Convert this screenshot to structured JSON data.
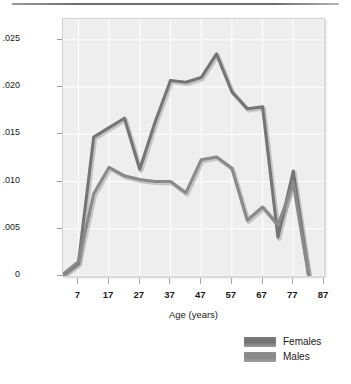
{
  "chart_data": {
    "type": "line",
    "title": "",
    "xlabel": "Age (years)",
    "ylabel": "Probability of onset",
    "xlim": [
      2,
      87
    ],
    "ylim": [
      0,
      0.0272
    ],
    "grid": true,
    "legend_position": "bottom-right",
    "xticks": [
      "7",
      "17",
      "27",
      "37",
      "47",
      "57",
      "67",
      "77",
      "87"
    ],
    "xtick_values": [
      7,
      17,
      27,
      37,
      47,
      57,
      67,
      77,
      87
    ],
    "yticks": [
      ".025",
      ".020",
      ".015",
      ".010",
      ".005",
      "0"
    ],
    "ytick_values": [
      0.025,
      0.02,
      0.015,
      0.01,
      0.005,
      0
    ],
    "x": [
      2,
      7,
      12,
      17,
      22,
      27,
      32,
      37,
      42,
      47,
      52,
      57,
      62,
      67,
      72,
      77,
      82
    ],
    "series": [
      {
        "name": "Females",
        "color": "#757575",
        "values": [
          0.0001,
          0.0013,
          0.0147,
          0.0157,
          0.0167,
          0.0113,
          0.0163,
          0.0207,
          0.0205,
          0.021,
          0.0235,
          0.0195,
          0.0177,
          0.0179,
          0.0041,
          0.0111,
          0.0
        ]
      },
      {
        "name": "Males",
        "color": "#8a8a8a",
        "values": [
          0.0002,
          0.0015,
          0.0087,
          0.0115,
          0.0106,
          0.0102,
          0.01,
          0.01,
          0.0088,
          0.0123,
          0.0126,
          0.0114,
          0.0059,
          0.0073,
          0.0054,
          0.0098,
          0.0
        ]
      }
    ]
  },
  "axes": {
    "ylabel": "Probability of onset",
    "xlabel": "Age (years)"
  },
  "legend": {
    "items": [
      {
        "label": "Females",
        "color": "#757575"
      },
      {
        "label": "Males",
        "color": "#8a8a8a"
      }
    ]
  },
  "style": {
    "plot_background": "#eeeeee",
    "gridline_color": "#ffffff",
    "axis_text_color": "#1a1a1a",
    "page_background": "#ffffff"
  }
}
